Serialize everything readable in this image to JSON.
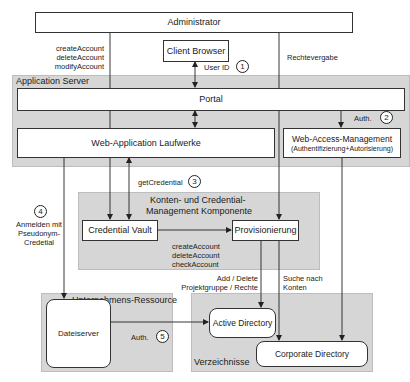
{
  "nodes": {
    "administrator": "Administrator",
    "client_browser": "Client Browser",
    "portal": "Portal",
    "web_app": "Web-Application Laufwerke",
    "wam_title": "Web-Access-Management",
    "wam_sub": "(Authentifizierung+Autorisierung)",
    "credential_vault": "Credential Vault",
    "provisionierung": "Provisionierung",
    "dateiserver": "Dateiserver",
    "active_directory": "Active Directory",
    "corporate_directory": "Corporate Directory"
  },
  "groups": {
    "application_server": "Application Server",
    "konten_line1": "Konten- und Credential-",
    "konten_line2": "Management Komponente",
    "unternehmens_ressource": "Unternehmens-Ressource",
    "verzeichnisse": "Verzeichnisse"
  },
  "labels": {
    "admin_ops": [
      "createAccount",
      "deleteAccount",
      "modifyAccount"
    ],
    "user_id": "User ID",
    "rechtevergabe": "Rechtevergabe",
    "auth2": "Auth.",
    "get_credential": "getCredential",
    "anmelden": [
      "Anmelden mit",
      "Pseudonym-",
      "Credetial"
    ],
    "vault_ops": [
      "createAccount",
      "deleteAccount",
      "checkAccount"
    ],
    "add_delete": [
      "Add / Delete",
      "Projektgruppe / Rechte"
    ],
    "suche": [
      "Suche nach",
      "Konten"
    ],
    "auth5": "Auth."
  },
  "steps": [
    "1",
    "2",
    "3",
    "4",
    "5"
  ],
  "colors": {
    "group_fill": "#d6d6d6",
    "box_fill": "#ffffff",
    "line": "#222222"
  }
}
